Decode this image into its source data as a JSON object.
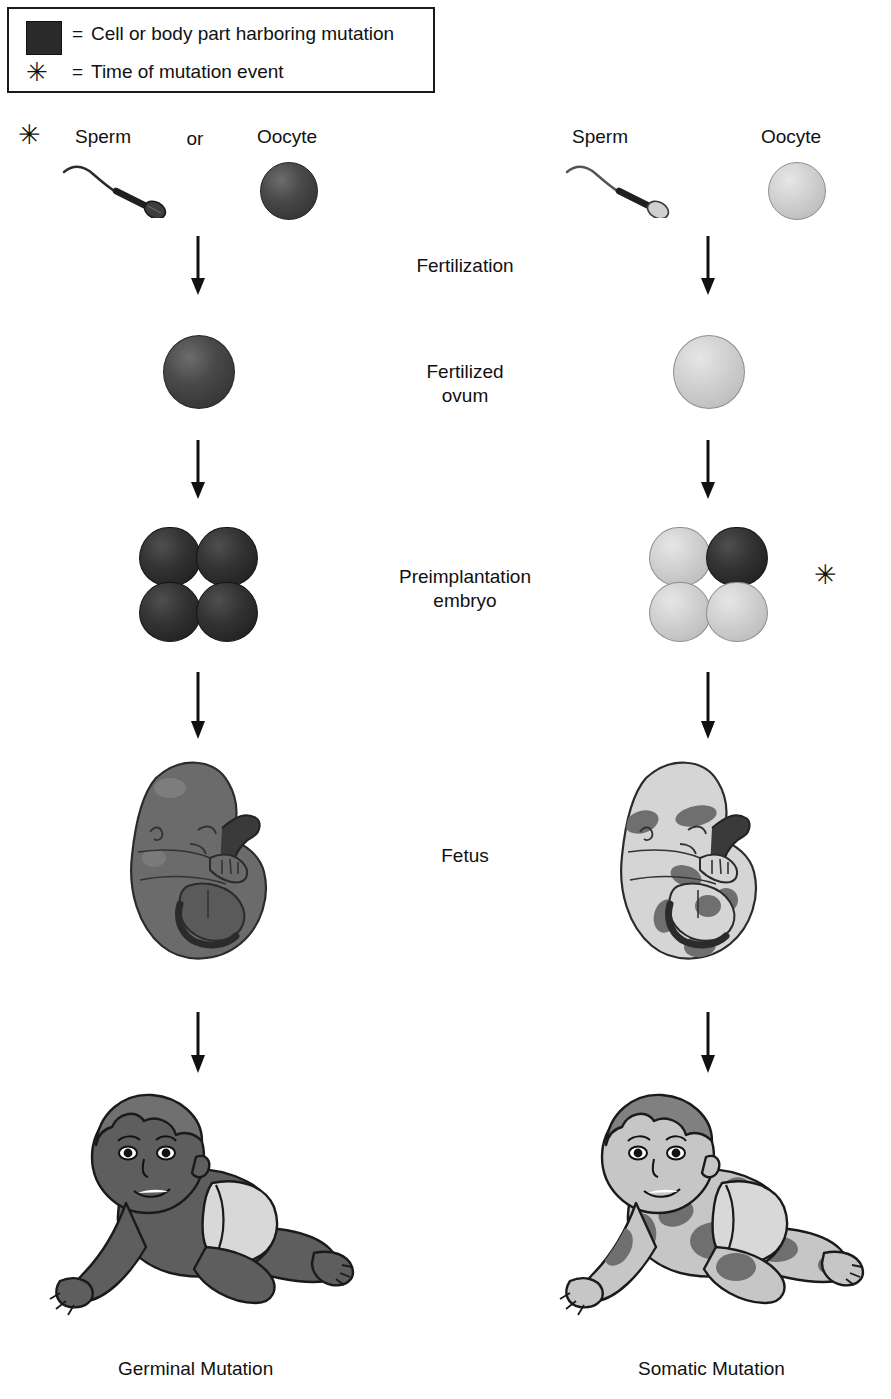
{
  "legend": {
    "equals": "=",
    "swatch_label": "Cell or body part harboring mutation",
    "star_glyph": "✳",
    "star_label": "Time of mutation event",
    "swatch_color": "#2a2a2a"
  },
  "center_labels": {
    "fertilization": "Fertilization",
    "fertilized_ovum_line1": "Fertilized",
    "fertilized_ovum_line2": "ovum",
    "preimplantation_line1": "Preimplantation",
    "preimplantation_line2": "embryo",
    "fetus": "Fetus"
  },
  "columns": [
    {
      "id": "germinal",
      "caption": "Germinal Mutation",
      "gamete_labels": {
        "sperm": "Sperm",
        "connector": "or",
        "oocyte": "Oocyte"
      },
      "mutation_marker": "✳",
      "mutation_marker_stage": "gamete",
      "oocyte_state": "mutant",
      "sperm_state": "normal",
      "ovum_state": "mutant",
      "embryo_cells": [
        "mutant",
        "mutant",
        "mutant",
        "mutant"
      ],
      "fetus_state": "fully-mutant",
      "baby_state": "fully-mutant"
    },
    {
      "id": "somatic",
      "caption": "Somatic Mutation",
      "gamete_labels": {
        "sperm": "Sperm",
        "connector": "",
        "oocyte": "Oocyte"
      },
      "mutation_marker": "✳",
      "mutation_marker_stage": "preimplantation-embryo",
      "oocyte_state": "normal",
      "sperm_state": "normal",
      "ovum_state": "normal",
      "embryo_cells": [
        "normal",
        "mutant",
        "normal",
        "normal"
      ],
      "fetus_state": "mosaic",
      "baby_state": "mosaic"
    }
  ],
  "colors": {
    "mutant_dark": "#3a3a3a",
    "mutant_darker": "#262626",
    "normal_light": "#cccccc",
    "outline": "#1a1a1a",
    "mosaic_patch": "#6f6f6f",
    "skin_mutant": "#5e5e5e",
    "skin_normal": "#c6c6c6"
  }
}
